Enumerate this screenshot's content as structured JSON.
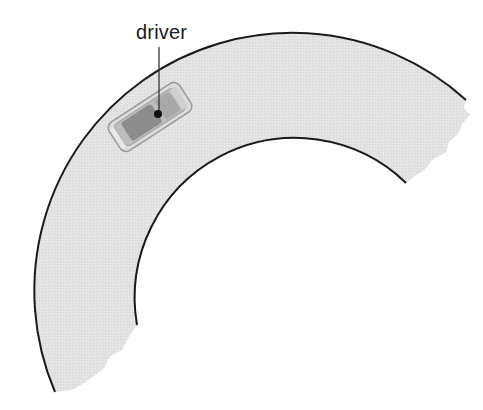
{
  "diagram": {
    "label": "driver",
    "colors": {
      "road": "#e4e4e4",
      "road_edge": "#1a1a1a",
      "car_body": "#d6d6d6",
      "car_interior": "#8c8c8c",
      "driver_dot": "#111111",
      "background": "#ffffff"
    }
  }
}
